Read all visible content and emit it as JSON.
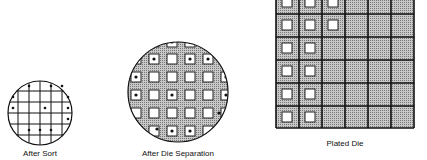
{
  "stages": [
    {
      "label": "After Sort"
    },
    {
      "label": "After Die Separation"
    },
    {
      "label": "Plated Die"
    }
  ],
  "colors": {
    "line": "#111111",
    "fill_gray": "#a8a8a8",
    "die_white": "#ffffff"
  }
}
